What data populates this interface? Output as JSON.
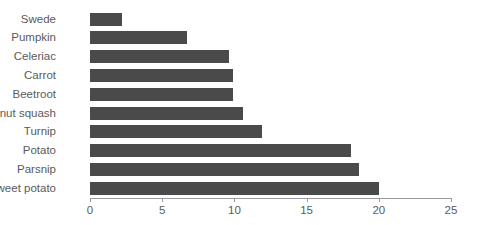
{
  "chart_data": {
    "type": "bar",
    "orientation": "horizontal",
    "title": "",
    "xlabel": "",
    "ylabel": "",
    "xlim": [
      0,
      25
    ],
    "xticks": [
      0,
      5,
      10,
      15,
      20,
      25
    ],
    "grid": false,
    "legend": null,
    "bar_color": "#4a4a4a",
    "categories": [
      "Swede",
      "Pumpkin",
      "Celeriac",
      "Carrot",
      "Beetroot",
      "Butternut squash",
      "Turnip",
      "Potato",
      "Parsnip",
      "Sweet potato"
    ],
    "values": [
      2.2,
      6.7,
      9.6,
      9.9,
      9.9,
      10.6,
      11.9,
      18.1,
      18.6,
      20.0
    ]
  },
  "axis": {
    "tick_labels": [
      "0",
      "5",
      "10",
      "15",
      "20",
      "25"
    ]
  }
}
